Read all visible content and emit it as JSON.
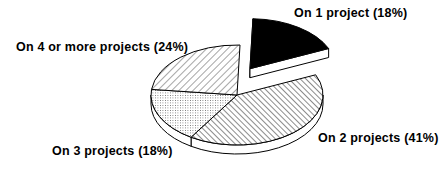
{
  "chart_data": {
    "type": "pie",
    "style": "3d-exploded",
    "title": "",
    "categories": [
      "On 1 project",
      "On 2 projects",
      "On 3 projects",
      "On 4 or more projects"
    ],
    "values": [
      18,
      41,
      18,
      24
    ],
    "units": "%",
    "labels": [
      "On 1 project (18%)",
      "On 2 projects (41%)",
      "On 3 projects (18%)",
      "On 4 or more projects (24%)"
    ],
    "fills": [
      "solid-black",
      "diagonal-hatch-backslash",
      "fine-dots",
      "diagonal-hatch-slash"
    ],
    "exploded": [
      true,
      false,
      false,
      false
    ],
    "legend": "none (direct labels)"
  },
  "labels": {
    "on1": "On 1 project (18%)",
    "on2": "On 2 projects (41%)",
    "on3": "On 3 projects (18%)",
    "on4": "On 4 or more projects (24%)"
  },
  "colors": {
    "ink": "#000000",
    "paper": "#ffffff"
  }
}
